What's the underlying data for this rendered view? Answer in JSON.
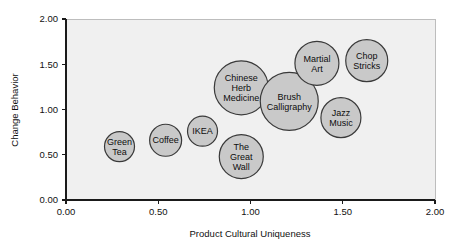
{
  "chart_data": {
    "type": "scatter",
    "title": "",
    "xlabel": "Product Cultural Uniqueness",
    "ylabel": "Change Behavior",
    "xlim": [
      0,
      2
    ],
    "ylim": [
      0,
      2
    ],
    "grid": false,
    "legend": "none",
    "xticks": [
      "0.00",
      "0.50",
      "1.00",
      "1.50",
      "2.00"
    ],
    "xtick_values": [
      0,
      0.5,
      1,
      1.5,
      2
    ],
    "yticks": [
      "0.00",
      "0.50",
      "1.00",
      "1.50",
      "2.00"
    ],
    "ytick_values": [
      0,
      0.5,
      1,
      1.5,
      2
    ],
    "bubble_fill": "#c9c9c9",
    "bubble_stroke": "#3a3a3a",
    "plot_background": "#f0f0f0",
    "points": [
      {
        "label": "Green Tea",
        "label_lines": [
          "Green",
          "Tea"
        ],
        "x": 0.29,
        "y": 0.59,
        "size": 15
      },
      {
        "label": "Coffee",
        "label_lines": [
          "Coffee"
        ],
        "x": 0.54,
        "y": 0.66,
        "size": 16
      },
      {
        "label": "IKEA",
        "label_lines": [
          "IKEA"
        ],
        "x": 0.74,
        "y": 0.76,
        "size": 15
      },
      {
        "label": "The Great Wall",
        "label_lines": [
          "The",
          "Great",
          "Wall"
        ],
        "x": 0.95,
        "y": 0.48,
        "size": 22
      },
      {
        "label": "Chinese Herb Medicine",
        "label_lines": [
          "Chinese",
          "Herb",
          "Medicine"
        ],
        "x": 0.95,
        "y": 1.24,
        "size": 27
      },
      {
        "label": "Brush Calligraphy",
        "label_lines": [
          "Brush",
          "Calligraphy"
        ],
        "x": 1.21,
        "y": 1.09,
        "size": 29
      },
      {
        "label": "Martial Art",
        "label_lines": [
          "Martial",
          "Art"
        ],
        "x": 1.36,
        "y": 1.51,
        "size": 22
      },
      {
        "label": "Chop Sticks",
        "label_lines": [
          "Chop",
          "Stricks"
        ],
        "x": 1.63,
        "y": 1.54,
        "size": 21
      },
      {
        "label": "Jazz Music",
        "label_lines": [
          "Jazz",
          "Music"
        ],
        "x": 1.49,
        "y": 0.91,
        "size": 20
      }
    ]
  }
}
